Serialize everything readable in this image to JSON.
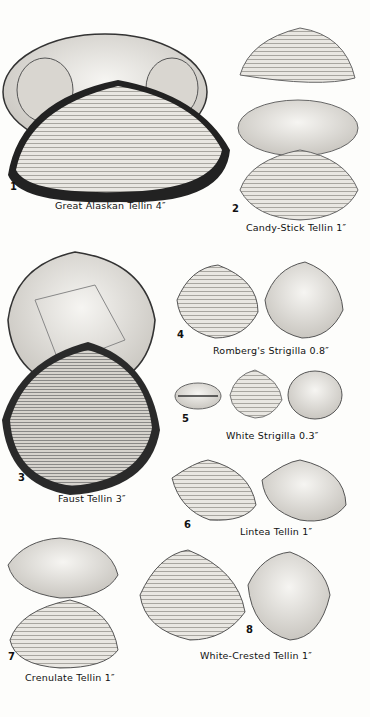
{
  "page": {
    "type": "field guide plate",
    "background": "#fdfdfb"
  },
  "specimens": [
    {
      "number": "1",
      "name": "Great Alaskan Tellin",
      "size": "4″",
      "caption": "Great Alaskan Tellin 4″"
    },
    {
      "number": "2",
      "name": "Candy-Stick Tellin",
      "size": "1″",
      "caption": "Candy-Stick Tellin 1″"
    },
    {
      "number": "3",
      "name": "Faust Tellin",
      "size": "3″",
      "caption": "Faust Tellin 3″"
    },
    {
      "number": "4",
      "name": "Romberg's Strigilla",
      "size": "0.8″",
      "caption": "Romberg's Strigilla 0.8″"
    },
    {
      "number": "5",
      "name": "White Strigilla",
      "size": "0.3″",
      "caption": "White Strigilla 0.3″"
    },
    {
      "number": "6",
      "name": "Lintea Tellin",
      "size": "1″",
      "caption": "Lintea Tellin 1″"
    },
    {
      "number": "7",
      "name": "Crenulate Tellin",
      "size": "1″",
      "caption": "Crenulate Tellin 1″"
    },
    {
      "number": "8",
      "name": "White-Crested Tellin",
      "size": "1″",
      "caption": "White-Crested Tellin 1″"
    }
  ]
}
